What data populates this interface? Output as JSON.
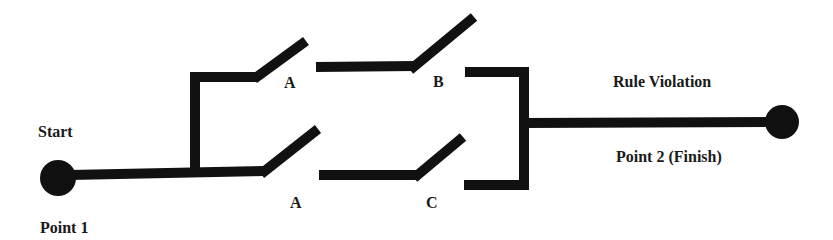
{
  "diagram": {
    "type": "switch-circuit",
    "colors": {
      "line": "#111111",
      "text": "#1a1a1a",
      "background": "#ffffff"
    },
    "labels": {
      "start": "Start",
      "point1": "Point 1",
      "rule_violation": "Rule Violation",
      "point2": "Point 2 (Finish)"
    },
    "switches": [
      {
        "id": "top-a",
        "label": "A",
        "branch": "upper"
      },
      {
        "id": "top-b",
        "label": "B",
        "branch": "upper"
      },
      {
        "id": "bottom-a",
        "label": "A",
        "branch": "lower"
      },
      {
        "id": "bottom-c",
        "label": "C",
        "branch": "lower"
      }
    ],
    "nodes": [
      {
        "id": "point-1",
        "role": "start"
      },
      {
        "id": "point-2",
        "role": "finish"
      }
    ]
  }
}
